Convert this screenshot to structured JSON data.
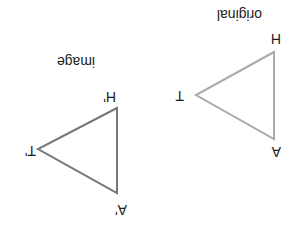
{
  "orientation": "rotated 180 degrees",
  "original": {
    "caption": "original",
    "color": "#aaaaaa",
    "vertices": [
      {
        "label": "H",
        "x": 274,
        "y": 52
      },
      {
        "label": "T",
        "x": 196,
        "y": 95
      },
      {
        "label": "A",
        "x": 274,
        "y": 139
      }
    ]
  },
  "image": {
    "caption": "image",
    "color": "#777777",
    "vertices": [
      {
        "label": "H'",
        "x": 117,
        "y": 108
      },
      {
        "label": "T'",
        "x": 38,
        "y": 149
      },
      {
        "label": "A'",
        "x": 117,
        "y": 193
      }
    ]
  }
}
